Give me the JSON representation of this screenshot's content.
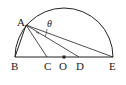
{
  "diagram": {
    "type": "semicircle-geometry",
    "points": {
      "A": "A",
      "B": "B",
      "C": "C",
      "O": "O",
      "D": "D",
      "E": "E"
    },
    "angle_label": "θ",
    "segments": [
      "AB",
      "AC",
      "AD",
      "AE",
      "BE"
    ],
    "colors": {
      "stroke": "#222222",
      "background": "#ffffff"
    }
  }
}
